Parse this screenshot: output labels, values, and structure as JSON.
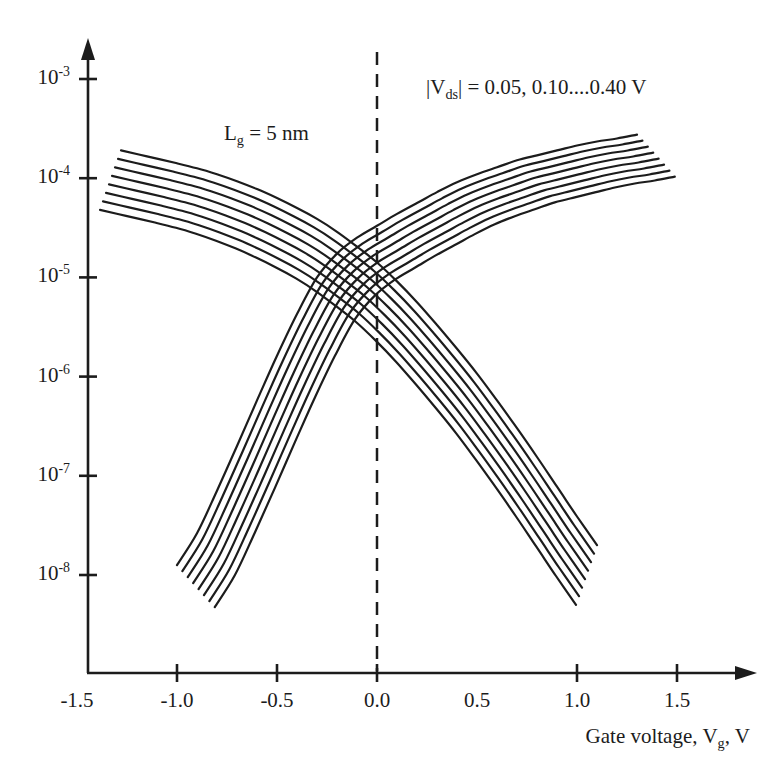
{
  "figure": {
    "width": 783,
    "height": 779,
    "colors": {
      "background": "#ffffff",
      "ink": "#1c1c1c"
    },
    "annotations": {
      "gate_length": {
        "prefix": "L",
        "sub": "g",
        "suffix": " = 5 nm"
      },
      "vds_range": {
        "prefix": "|V",
        "sub": "ds",
        "suffix": "| = 0.05, 0.10....0.40 V"
      }
    },
    "x_axis": {
      "label": {
        "prefix": "Gate voltage, V",
        "sub": "g",
        "suffix": ", V"
      },
      "tick_labels": [
        "-1.5",
        "-1.0",
        "-0.5",
        "0.0",
        "0.5",
        "1.0",
        "1.5"
      ],
      "tick_values": [
        -1.5,
        -1.0,
        -0.5,
        0.0,
        0.5,
        1.0,
        1.5
      ],
      "marked_tick_values": [
        -1.0,
        -0.5,
        0.0,
        1.0,
        1.5
      ]
    },
    "y_axis": {
      "base": "10",
      "tick_exponents": [
        -3,
        -4,
        -5,
        -6,
        -7,
        -8
      ]
    }
  },
  "chart_data": {
    "type": "line",
    "title": "",
    "xlabel": "Gate voltage, Vg, V",
    "ylabel": "",
    "y_scale": "log10",
    "xlim": [
      -1.5,
      1.9
    ],
    "y_exponent_range": [
      -3,
      -8
    ],
    "grid": false,
    "dashed_guide_x": 0.0,
    "annotations": [
      "Lg = 5 nm",
      "|Vds| = 0.05, 0.10....0.40 V"
    ],
    "vds_values_V_top_to_bottom": [
      0.4,
      0.35,
      0.3,
      0.25,
      0.2,
      0.15,
      0.1,
      0.05
    ],
    "families": [
      {
        "name": "increasing-branch",
        "description": "current rises with gate voltage; 8 curves for |Vds| = 0.40 V (top) down to 0.05 V (bottom)",
        "curve_count": 8,
        "per_curve_offset": {
          "dvg_V": 0.027,
          "dlog10I": -0.0605
        },
        "base_points_vg_log10I": [
          [
            -1.0,
            -7.9
          ],
          [
            -0.9,
            -7.58
          ],
          [
            -0.8,
            -7.15
          ],
          [
            -0.7,
            -6.7
          ],
          [
            -0.6,
            -6.24
          ],
          [
            -0.5,
            -5.79
          ],
          [
            -0.4,
            -5.37
          ],
          [
            -0.3,
            -5.0
          ],
          [
            -0.2,
            -4.76
          ],
          [
            -0.1,
            -4.6
          ],
          [
            0.0,
            -4.48
          ],
          [
            0.1,
            -4.36
          ],
          [
            0.2,
            -4.25
          ],
          [
            0.3,
            -4.14
          ],
          [
            0.4,
            -4.04
          ],
          [
            0.5,
            -3.96
          ],
          [
            0.6,
            -3.89
          ],
          [
            0.7,
            -3.82
          ],
          [
            0.8,
            -3.77
          ],
          [
            0.9,
            -3.72
          ],
          [
            1.0,
            -3.67
          ],
          [
            1.1,
            -3.63
          ],
          [
            1.2,
            -3.6
          ],
          [
            1.3,
            -3.56
          ]
        ]
      },
      {
        "name": "decreasing-branch",
        "description": "current falls with gate voltage; 8 curves for |Vds| = 0.40 V (top) down to 0.05 V (bottom)",
        "curve_count": 8,
        "per_curve_offset": {
          "dvg_V": -0.015,
          "dlog10I": -0.0857
        },
        "base_points_vg_log10I": [
          [
            -1.28,
            -3.72
          ],
          [
            -1.15,
            -3.78
          ],
          [
            -1.0,
            -3.85
          ],
          [
            -0.9,
            -3.9
          ],
          [
            -0.8,
            -3.96
          ],
          [
            -0.7,
            -4.03
          ],
          [
            -0.6,
            -4.11
          ],
          [
            -0.5,
            -4.2
          ],
          [
            -0.4,
            -4.3
          ],
          [
            -0.3,
            -4.41
          ],
          [
            -0.2,
            -4.54
          ],
          [
            -0.1,
            -4.69
          ],
          [
            0.0,
            -4.85
          ],
          [
            0.1,
            -5.04
          ],
          [
            0.2,
            -5.25
          ],
          [
            0.3,
            -5.48
          ],
          [
            0.4,
            -5.72
          ],
          [
            0.5,
            -5.97
          ],
          [
            0.6,
            -6.24
          ],
          [
            0.7,
            -6.52
          ],
          [
            0.8,
            -6.81
          ],
          [
            0.9,
            -7.11
          ],
          [
            1.0,
            -7.41
          ],
          [
            1.1,
            -7.7
          ]
        ]
      }
    ]
  }
}
